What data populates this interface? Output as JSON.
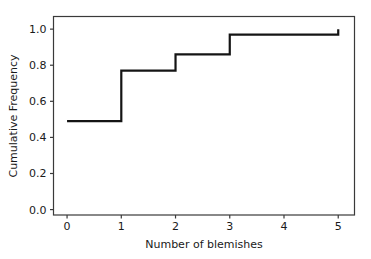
{
  "chart_data": {
    "type": "line",
    "subtype": "step-ecdf",
    "title": "",
    "xlabel": "Number of blemishes",
    "ylabel": "Cumulative Frequency",
    "xlim": [
      -0.25,
      5.3
    ],
    "ylim": [
      -0.03,
      1.07
    ],
    "xticks": [
      0,
      1,
      2,
      3,
      4,
      5
    ],
    "xtick_labels": [
      "0",
      "1",
      "2",
      "3",
      "4",
      "5"
    ],
    "yticks": [
      0.0,
      0.2,
      0.4,
      0.6,
      0.8,
      1.0
    ],
    "ytick_labels": [
      "0.0",
      "0.2",
      "0.4",
      "0.6",
      "0.8",
      "1.0"
    ],
    "grid": false,
    "legend": false,
    "line_color": "#141414",
    "x": [
      0,
      1,
      2,
      3,
      5
    ],
    "y": [
      0.49,
      0.77,
      0.86,
      0.97,
      1.0
    ],
    "steps": [
      {
        "x_start": 0,
        "x_end": 1,
        "value": 0.49
      },
      {
        "x_start": 1,
        "x_end": 2,
        "value": 0.77
      },
      {
        "x_start": 2,
        "x_end": 3,
        "value": 0.86
      },
      {
        "x_start": 3,
        "x_end": 5,
        "value": 0.97
      },
      {
        "x_start": 5,
        "x_end": 5,
        "value": 1.0
      }
    ]
  }
}
